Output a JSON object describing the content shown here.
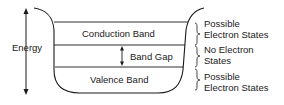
{
  "diagram": {
    "axis_label": "Energy",
    "bands": [
      {
        "label": "Conduction Band"
      },
      {
        "label": "Band Gap"
      },
      {
        "label": "Valence Band"
      }
    ],
    "side_labels": [
      {
        "line1": "Possible",
        "line2": "Electron States"
      },
      {
        "line1": "No Electron",
        "line2": "States"
      },
      {
        "line1": "Possible",
        "line2": "Electron States"
      }
    ],
    "colors": {
      "line": "#1a1a1a",
      "background": "#ffffff"
    }
  }
}
